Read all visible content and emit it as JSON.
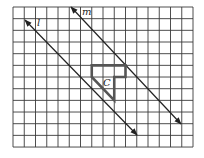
{
  "diagram": {
    "type": "grid-reflection",
    "grid": {
      "columns": 16,
      "rows": 12,
      "origin_px": [
        13,
        7
      ],
      "cell_w": 11.25,
      "cell_h": 11.67,
      "line_color": "#3a3a3a"
    },
    "lines": [
      {
        "name": "l",
        "label": "l",
        "start_px": [
          25,
          20
        ],
        "end_px": [
          137,
          135
        ],
        "label_px": [
          37,
          26
        ]
      },
      {
        "name": "m",
        "label": "m",
        "start_px": [
          71,
          7
        ],
        "end_px": [
          181,
          124
        ],
        "label_px": [
          82,
          15
        ]
      }
    ],
    "figure": {
      "label": "C",
      "vertices_grid": [
        [
          7,
          5
        ],
        [
          10,
          5
        ],
        [
          10,
          6
        ],
        [
          9,
          6
        ],
        [
          9,
          8
        ],
        [
          7,
          6
        ]
      ],
      "label_px": [
        103,
        86
      ],
      "stroke_color": "#555555"
    }
  }
}
